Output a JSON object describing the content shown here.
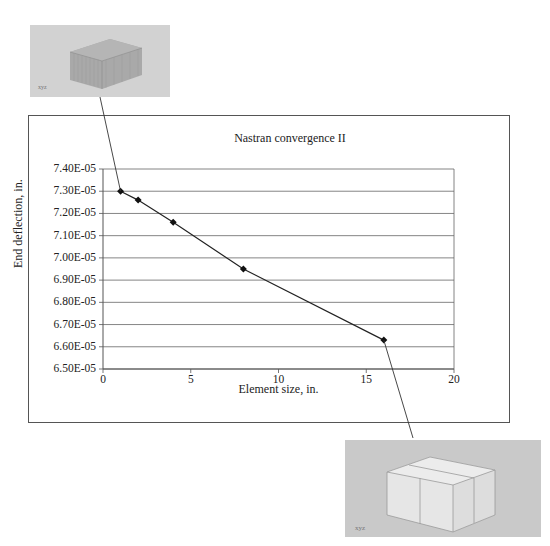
{
  "chart_data": {
    "type": "line",
    "title": "Nastran convergence II",
    "xlabel": "Element size, in.",
    "ylabel": "End deflection, in.",
    "xlim": [
      0,
      20
    ],
    "ylim": [
      6.5e-05,
      7.4e-05
    ],
    "x_ticks": [
      "0",
      "5",
      "10",
      "15",
      "20"
    ],
    "y_ticks": [
      "7.40E-05",
      "7.30E-05",
      "7.20E-05",
      "7.10E-05",
      "7.00E-05",
      "6.90E-05",
      "6.80E-05",
      "6.70E-05",
      "6.60E-05",
      "6.50E-05"
    ],
    "grid": "horizontal",
    "legend": "none",
    "marker": "diamond",
    "series": [
      {
        "name": "End deflection",
        "x": [
          1,
          2,
          4,
          8,
          16
        ],
        "values": [
          7.3e-05,
          7.26e-05,
          7.16e-05,
          6.95e-05,
          6.63e-05
        ]
      }
    ],
    "annotations": [
      {
        "type": "image-callout",
        "points_to_x": 1,
        "description": "finely meshed block (small elements)"
      },
      {
        "type": "image-callout",
        "points_to_x": 16,
        "description": "coarse mesh block of two cubic elements"
      }
    ]
  }
}
